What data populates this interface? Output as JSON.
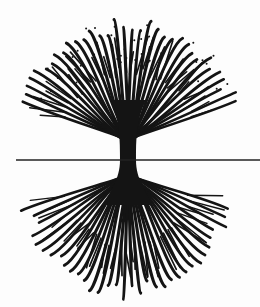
{
  "illustration": {
    "subject": "tree with branches above ground line and mirrored roots below",
    "colors": {
      "ink": "#141414",
      "background": "#fdfdfd",
      "ground_line": "#222222"
    },
    "ground_line": {
      "x1": 16,
      "x2": 260,
      "y": 160,
      "stroke_width": 1.3
    },
    "trunk": {
      "cx": 128,
      "top_y": 100,
      "bottom_y": 205,
      "neck_half_width": 8,
      "flare_half_width": 18
    },
    "canopy": {
      "cx": 128,
      "cy": 128,
      "radius_x": 118,
      "radius_y": 110,
      "branch_count": 34,
      "start_angle_deg": 195,
      "end_angle_deg": 345
    },
    "roots": {
      "cx": 128,
      "cy": 180,
      "radius_x": 112,
      "radius_y": 120,
      "root_count": 34,
      "start_angle_deg": 15,
      "end_angle_deg": 165
    },
    "dot_count": 38
  }
}
